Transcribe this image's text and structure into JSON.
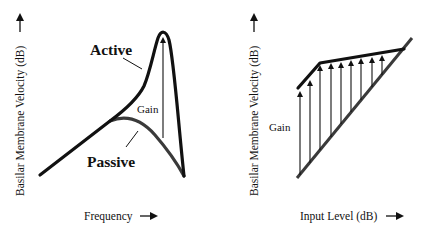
{
  "colors": {
    "ink": "#111111",
    "passive_curve": "#3a3a3a",
    "background": "#ffffff"
  },
  "left_panel": {
    "title": "Active vs Passive frequency response",
    "y_axis_label": "Basilar Membrane Velocity (dB)",
    "y_axis_arrow": "↑",
    "x_axis_label": "Frequency",
    "x_axis_arrow": "→",
    "active_label": "Active",
    "passive_label": "Passive",
    "gain_label": "Gain"
  },
  "right_panel": {
    "title": "Input-output function",
    "y_axis_label": "Basilar Membrane Velocity (dB)",
    "y_axis_arrow": "↑",
    "x_axis_label": "Input Level (dB)",
    "x_axis_arrow": "→",
    "gain_label": "Gain",
    "gain_arrow_count": 9,
    "gain_arrows_desc": "Gain decreases as input level increases"
  }
}
